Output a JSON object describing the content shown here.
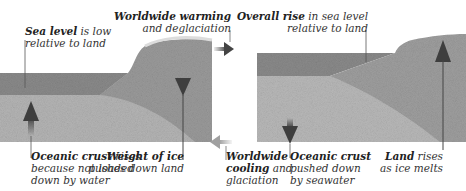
{
  "left_panel": {
    "state": "Glaciated",
    "labels": {
      "sea_level": {
        "bold": "Sea level",
        "rest1": " is low",
        "line2": "relative to land"
      },
      "oceanic_crust": {
        "bold": "Oceanic crust",
        "rest1": " rises",
        "line2": "because not loaded",
        "line3": "down by water"
      },
      "weight_of_ice": {
        "bold": "Weight of ice",
        "line2": "pushes down land"
      }
    }
  },
  "right_panel": {
    "state": "Deglaciated",
    "labels": {
      "overall_rise": {
        "bold": "Overall rise",
        "rest1": " in sea level",
        "line2": "relative to land"
      },
      "oceanic_crust": {
        "bold": "Oceanic crust",
        "line2": "pushed down",
        "line3": "by seawater"
      },
      "land_rises": {
        "bold": "Land",
        "rest1": " rises",
        "line2": "as ice melts"
      }
    }
  },
  "transitions": {
    "warming": {
      "bold": "Worldwide warming",
      "line2": "and deglaciation",
      "direction": "right"
    },
    "cooling": {
      "bold": "Worldwide",
      "line2_bold": "cooling",
      "line2_rest": " and",
      "line3": "glaciation",
      "direction": "left"
    }
  },
  "colors": {
    "sea": "#8a8a8a",
    "land": "#9d9d9d",
    "crust": "#b4b4b4",
    "arrow": "#4a4a4a",
    "ice": "#d8d8d8"
  }
}
